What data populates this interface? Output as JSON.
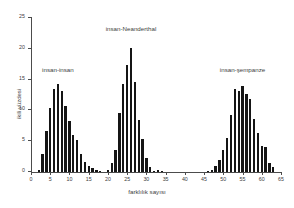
{
  "chart_data": {
    "type": "bar",
    "title": "",
    "subtitle": "",
    "xlabel": "farklılık sayısı",
    "ylabel": "ikili yüzdesi",
    "xlim": [
      0,
      65
    ],
    "ylim": [
      0,
      25
    ],
    "grid": false,
    "legend_position": "none",
    "xticks": [
      0,
      5,
      10,
      15,
      20,
      25,
      30,
      35,
      40,
      45,
      50,
      55,
      60,
      65
    ],
    "yticks": [
      0,
      5,
      10,
      15,
      20,
      25
    ],
    "bar_color": "#151515",
    "axis_color": "#4c4c4c",
    "annotations": [
      {
        "text": "insan-insan",
        "x": 7,
        "y": 16.0
      },
      {
        "text": "insan-Neanderthal",
        "x": 26,
        "y": 22.7
      },
      {
        "text": "insan-şempanze",
        "x": 55,
        "y": 16.0
      }
    ],
    "series": [
      {
        "name": "insan-insan",
        "x": [
          2,
          3,
          4,
          5,
          6,
          7,
          8,
          9,
          10,
          11,
          12,
          13,
          14,
          15,
          16,
          17,
          18
        ],
        "values": [
          0.3,
          2.9,
          6.6,
          10.4,
          13.4,
          14.3,
          13.2,
          10.7,
          8.3,
          6.0,
          5.2,
          3.0,
          1.6,
          0.9,
          0.6,
          0.3,
          0.2
        ]
      },
      {
        "name": "insan-Neanderthal",
        "x": [
          20,
          21,
          22,
          23,
          24,
          25,
          26,
          27,
          28,
          29,
          30,
          31,
          32,
          33,
          34
        ],
        "values": [
          0.3,
          1.5,
          3.6,
          9.6,
          14.3,
          17.3,
          20.1,
          14.6,
          8.4,
          5.3,
          2.2,
          0.8,
          0.2,
          0.3,
          0.2
        ]
      },
      {
        "name": "insan-şempanze",
        "x": [
          46,
          47,
          48,
          49,
          50,
          51,
          52,
          53,
          54,
          55,
          56,
          57,
          58,
          59,
          60,
          61,
          62,
          63
        ],
        "values": [
          0.2,
          0.3,
          1.0,
          2.0,
          3.6,
          5.5,
          9.2,
          13.4,
          13.1,
          14.0,
          12.7,
          11.8,
          8.6,
          6.4,
          4.2,
          4.0,
          1.5,
          0.8
        ]
      }
    ]
  }
}
